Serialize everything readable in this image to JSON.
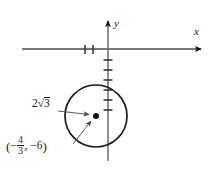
{
  "figure": {
    "type": "coordinate-plane-with-circle",
    "background_color": "#ffffff",
    "ink_color": "#1a1a1a",
    "axes": {
      "x_axis_label": "x",
      "y_axis_label": "y",
      "origin_px": [
        108,
        49
      ],
      "x_axis_span_px": [
        22,
        205
      ],
      "y_axis_span_px": [
        18,
        161
      ],
      "x_tick_positions_px": [
        85,
        93
      ],
      "x_tick_count": 2,
      "y_tick_positions_px": [
        60,
        70,
        80,
        90,
        100,
        110
      ],
      "y_tick_count": 6,
      "tick_half_length_px": 4,
      "arrowheads": [
        "x-positive",
        "y-positive"
      ]
    },
    "circle": {
      "center_px": [
        96,
        116
      ],
      "radius_px": 31,
      "stroke_width": 1.6,
      "center_dot_radius_px": 3
    },
    "annotations": {
      "radius": {
        "text_prefix": "2",
        "radical_glyph": "√",
        "radicand": "3",
        "full_text": "2√3",
        "arrow_from_px": [
          58,
          111
        ],
        "arrow_to_px": [
          92,
          114
        ]
      },
      "center": {
        "open_paren": "(",
        "sign_x": "−",
        "numerator": "4",
        "denominator": "3",
        "comma": ",",
        "sign_y": "−",
        "value_y": "6",
        "close_paren": ")",
        "full_text": "(−4/3, −6)",
        "arrow_from_px": [
          74,
          143
        ],
        "arrow_to_px": [
          93,
          120
        ]
      }
    }
  }
}
